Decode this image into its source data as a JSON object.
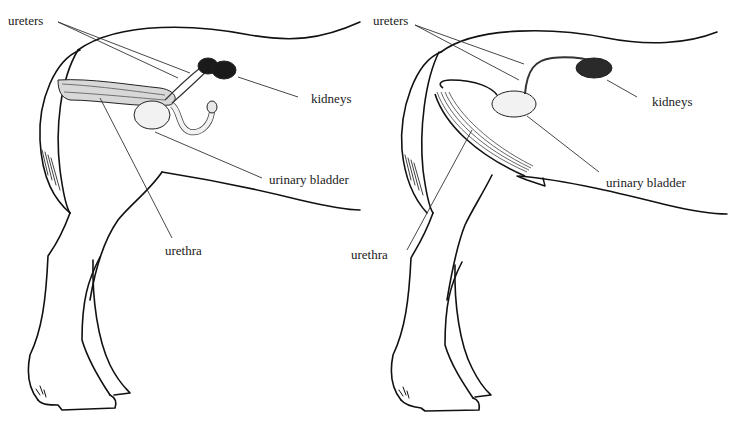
{
  "figure": {
    "panels": [
      {
        "id": "left",
        "labels": {
          "ureters": "ureters",
          "kidneys": "kidneys",
          "urinary_bladder": "urinary bladder",
          "urethra": "urethra"
        }
      },
      {
        "id": "right",
        "labels": {
          "ureters": "ureters",
          "kidneys": "kidneys",
          "urinary_bladder": "urinary bladder",
          "urethra": "urethra"
        }
      }
    ]
  },
  "colors": {
    "outline": "#111111",
    "leader": "#333333",
    "organ_fill": "#f2f2f2",
    "kidney_fill": "#1a1a1a"
  }
}
